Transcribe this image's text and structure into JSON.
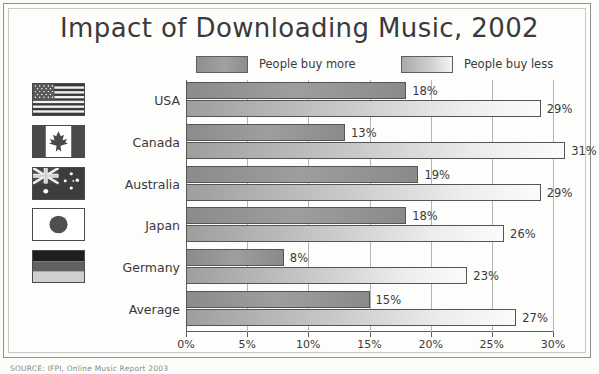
{
  "title": "Impact of Downloading Music, 2002",
  "source_note": "SOURCE: IFPI, Online Music Report 2003",
  "legend": {
    "entries": [
      {
        "label": "People buy more",
        "swatch": "more",
        "color": "#9e9e9e"
      },
      {
        "label": "People buy less",
        "swatch": "less",
        "color": "#d2d2d2"
      }
    ]
  },
  "axis": {
    "tick_labels": [
      "0%",
      "5%",
      "10%",
      "15%",
      "20%",
      "25%",
      "30%"
    ],
    "tick_values": [
      0,
      5,
      10,
      15,
      20,
      25,
      30
    ],
    "min": 0,
    "max": 30
  },
  "rows": [
    {
      "category": "USA",
      "flag": "flag-usa",
      "more": 18,
      "less": 29,
      "more_label": "18%",
      "less_label": "29%"
    },
    {
      "category": "Canada",
      "flag": "flag-canada",
      "more": 13,
      "less": 31,
      "more_label": "13%",
      "less_label": "31%"
    },
    {
      "category": "Australia",
      "flag": "flag-australia",
      "more": 19,
      "less": 29,
      "more_label": "19%",
      "less_label": "29%"
    },
    {
      "category": "Japan",
      "flag": "flag-japan",
      "more": 18,
      "less": 26,
      "more_label": "18%",
      "less_label": "26%"
    },
    {
      "category": "Germany",
      "flag": "flag-germany",
      "more": 8,
      "less": 23,
      "more_label": "8%",
      "less_label": "23%"
    },
    {
      "category": "Average",
      "flag": null,
      "more": 15,
      "less": 27,
      "more_label": "15%",
      "less_label": "27%"
    }
  ],
  "chart_data": {
    "type": "bar",
    "title": "Impact of Downloading Music, 2002",
    "xlabel": "",
    "ylabel": "",
    "orientation": "horizontal",
    "categories": [
      "USA",
      "Canada",
      "Australia",
      "Japan",
      "Germany",
      "Average"
    ],
    "series": [
      {
        "name": "People buy more",
        "values": [
          18,
          13,
          19,
          18,
          8,
          15
        ],
        "color": "#9e9e9e"
      },
      {
        "name": "People buy less",
        "values": [
          29,
          31,
          29,
          26,
          23,
          27
        ],
        "color": "#d2d2d2"
      }
    ],
    "xlim": [
      0,
      30
    ],
    "xticks": [
      0,
      5,
      10,
      15,
      20,
      25,
      30
    ],
    "xtick_labels": [
      "0%",
      "5%",
      "10%",
      "15%",
      "20%",
      "25%",
      "30%"
    ],
    "grid": true,
    "legend_position": "top",
    "value_labels": true,
    "units": "percent"
  }
}
